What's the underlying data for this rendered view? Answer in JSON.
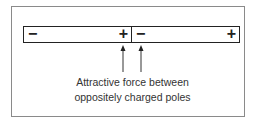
{
  "diagram": {
    "magnets": [
      {
        "left_pole": "−",
        "right_pole": "+"
      },
      {
        "left_pole": "−",
        "right_pole": "+"
      }
    ],
    "caption": {
      "line1": "Attractive force between",
      "line2": "oppositely charged poles"
    },
    "colors": {
      "stroke": "#222222",
      "frame": "#8a8a8a",
      "text": "#333333"
    }
  }
}
